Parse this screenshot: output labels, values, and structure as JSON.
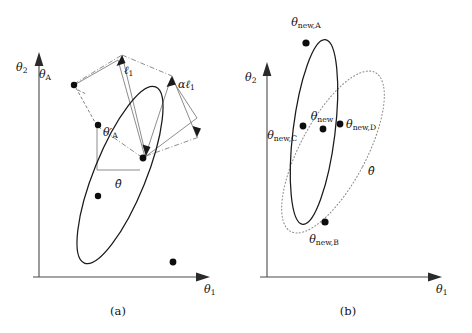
{
  "figure": {
    "width": 472,
    "height": 333,
    "background": "#ffffff",
    "ink_color": "#111111",
    "dotted_color": "#8a8a8a"
  },
  "panels": [
    {
      "id": "a",
      "caption": "(a)",
      "axes": {
        "x_label_theta": "θ",
        "x_label_sub": "1",
        "y_label_theta": "θ",
        "y_label_sub": "2"
      },
      "ellipse": {
        "style": "solid",
        "center_x": 120,
        "center_y": 175,
        "rx": 26,
        "ry": 95,
        "rotation_deg": 22
      },
      "points": [
        {
          "name": "theta-A",
          "label_theta": "θ",
          "label_sub": "A",
          "prime": false,
          "x": 74,
          "y": 85,
          "label_x": 52,
          "label_y": 76
        },
        {
          "name": "theta-A-prime",
          "label_theta": "θ",
          "label_sub": "A",
          "prime": true,
          "x": 98,
          "y": 125,
          "label_x": 103,
          "label_y": 133
        },
        {
          "name": "theta-hat",
          "label_theta": "θ",
          "label_sub": "",
          "prime": false,
          "hat": true,
          "x": 143,
          "y": 158,
          "label_x": 119,
          "label_y": 186
        },
        {
          "name": "point-lower-left",
          "label_theta": "",
          "label_sub": "",
          "x": 98,
          "y": 196,
          "label_x": 0,
          "label_y": 0
        },
        {
          "name": "point-bottom-right",
          "label_theta": "",
          "label_sub": "",
          "x": 173,
          "y": 262,
          "label_x": 0,
          "label_y": 0
        }
      ],
      "dimensions": [
        {
          "name": "ell-1",
          "label_theta": "ℓ",
          "label_sub": "1",
          "prefix": "",
          "label_x": 128,
          "label_y": 72
        },
        {
          "name": "alpha-ell-1",
          "label_theta": "ℓ",
          "label_sub": "1",
          "prefix": "α",
          "label_x": 186,
          "label_y": 85
        }
      ]
    },
    {
      "id": "b",
      "caption": "(b)",
      "axes": {
        "x_label_theta": "θ",
        "x_label_sub": "1",
        "y_label_theta": "θ",
        "y_label_sub": "2"
      },
      "ellipse_solid": {
        "style": "solid",
        "center_x": 78,
        "center_y": 132,
        "rx": 21,
        "ry": 93,
        "rotation_deg": 7
      },
      "ellipse_dotted": {
        "style": "dotted",
        "center_x": 97,
        "center_y": 152,
        "rx": 33,
        "ry": 90,
        "rotation_deg": 28
      },
      "points": [
        {
          "name": "theta-new-A",
          "label_theta": "θ",
          "label_sub": "new,A",
          "x": 70,
          "y": 43,
          "label_x": 66,
          "label_y": 20,
          "anchor": "middle"
        },
        {
          "name": "theta-new",
          "label_theta": "θ",
          "label_sub": "new",
          "x": 87,
          "y": 129,
          "label_x": 86,
          "label_y": 119,
          "anchor": "middle"
        },
        {
          "name": "theta-new-C",
          "label_theta": "θ",
          "label_sub": "new,C",
          "x": 67,
          "y": 126,
          "label_x": 62,
          "label_y": 133,
          "anchor": "end"
        },
        {
          "name": "theta-new-D",
          "label_theta": "θ",
          "label_sub": "new,D",
          "x": 104,
          "y": 124,
          "label_x": 110,
          "label_y": 128,
          "anchor": "start"
        },
        {
          "name": "theta-new-B",
          "label_theta": "θ",
          "label_sub": "new,B",
          "x": 89,
          "y": 222,
          "label_x": 86,
          "label_y": 240,
          "anchor": "middle"
        }
      ],
      "theta_hat": {
        "name": "theta-hat",
        "label_theta": "θ",
        "hat": true,
        "label_x": 134,
        "label_y": 172
      }
    }
  ]
}
